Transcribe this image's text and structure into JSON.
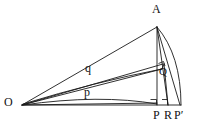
{
  "figure": {
    "type": "geometry-diagram",
    "stroke_color": "#1a1a1a",
    "background_color": "#ffffff",
    "width": 199,
    "height": 125,
    "labels": {
      "A": "A",
      "O": "O",
      "Q": "Q",
      "P": "P",
      "R": "R",
      "P_prime": "P′",
      "p": "p",
      "q": "q"
    },
    "points": {
      "A": {
        "x": 157,
        "y": 27
      },
      "O": {
        "x": 22,
        "y": 105
      },
      "Q": {
        "x": 161,
        "y": 71
      },
      "P": {
        "x": 157,
        "y": 105
      },
      "R": {
        "x": 168,
        "y": 105
      },
      "P_prime": {
        "x": 180,
        "y": 105
      }
    },
    "label_positions": {
      "A": {
        "x": 152,
        "y": 3
      },
      "O": {
        "x": 4,
        "y": 96
      },
      "Q": {
        "x": 159,
        "y": 66
      },
      "P": {
        "x": 153,
        "y": 109
      },
      "R": {
        "x": 164,
        "y": 109
      },
      "P_prime": {
        "x": 174,
        "y": 109
      },
      "p": {
        "x": 84,
        "y": 86
      },
      "q": {
        "x": 85,
        "y": 62
      }
    },
    "right_angle_marks": [
      {
        "at": "P",
        "x": 150,
        "y": 98
      },
      {
        "at": "R",
        "x": 161,
        "y": 98
      },
      {
        "at": "Q",
        "x": 158,
        "y": 60
      }
    ],
    "segments": [
      {
        "name": "O-A",
        "from": "O",
        "to": "A"
      },
      {
        "name": "O-Q",
        "from": "O",
        "to": "Q"
      },
      {
        "name": "O-P",
        "from": "O",
        "to": "P"
      },
      {
        "name": "O-P-prime",
        "from": "O",
        "to": "P_prime"
      },
      {
        "name": "A-P",
        "from": "A",
        "to": "P"
      },
      {
        "name": "A-R",
        "from": "A",
        "to": "R"
      },
      {
        "name": "A-P-prime",
        "from": "A",
        "to": "P_prime"
      },
      {
        "name": "Q-R",
        "from": "Q",
        "to": "R"
      },
      {
        "name": "P-P-prime",
        "from": "P",
        "to": "P_prime"
      }
    ],
    "arcs": [
      {
        "name": "arc-A-to-P-prime",
        "from": "A",
        "to": "P_prime",
        "bulges": "right"
      },
      {
        "name": "arc-p-O-to-P",
        "from": "O",
        "to": "P",
        "bulges": "up"
      },
      {
        "name": "arc-q-O-to-Q",
        "from": "O",
        "to": "Q",
        "bulges": "up"
      }
    ]
  }
}
